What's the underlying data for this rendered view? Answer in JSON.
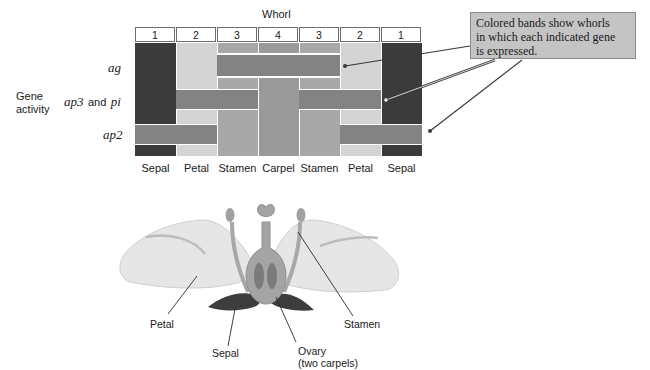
{
  "diagram": {
    "whorl_title": "Whorl",
    "whorl_numbers": [
      "1",
      "2",
      "3",
      "4",
      "3",
      "2",
      "1"
    ],
    "organ_labels": [
      "Sepal",
      "Petal",
      "Stamen",
      "Carpel",
      "Stamen",
      "Petal",
      "Sepal"
    ],
    "row_group_label": [
      "Gene",
      "activity"
    ],
    "genes": {
      "ag": "ag",
      "ap3": "ap3",
      "and": "and",
      "pi": "pi",
      "ap2": "ap2"
    },
    "callout_text": [
      "Colored bands show whorls",
      "in which each indicated gene",
      "is expressed."
    ],
    "colors": {
      "sepal": "#3b3b3b",
      "petal": "#d4d4d4",
      "stamen": "#a8a8a8",
      "carpel": "#9a9a9a",
      "band": "#838383",
      "callout_bg": "#c4c4c4"
    }
  },
  "flower": {
    "labels": {
      "petal": "Petal",
      "sepal": "Sepal",
      "stamen": "Stamen",
      "ovary": "Ovary",
      "ovary_sub": "(two carpels)"
    }
  }
}
